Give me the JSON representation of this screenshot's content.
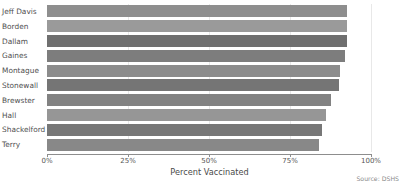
{
  "chart_data": {
    "type": "bar",
    "orientation": "horizontal",
    "title": "",
    "xlabel": "Percent Vaccinated",
    "ylabel": "",
    "xlim": [
      0,
      100
    ],
    "xticks": [
      "0%",
      "25%",
      "50%",
      "75%",
      "100%"
    ],
    "xtick_values": [
      0,
      25,
      50,
      75,
      100
    ],
    "grid": true,
    "legend": "none",
    "categories": [
      "Jeff Davis",
      "Borden",
      "Dallam",
      "Gaines",
      "Montague",
      "Stonewall",
      "Brewster",
      "Hall",
      "Shackelford",
      "Terry"
    ],
    "values": [
      92.5,
      92.5,
      92.5,
      92.0,
      90.5,
      90.0,
      87.5,
      86.0,
      85.0,
      84.0
    ],
    "bar_colors": [
      "#8e8e8e",
      "#9a9a9a",
      "#6f6f6f",
      "#7d7d7d",
      "#8c8c8c",
      "#757575",
      "#828282",
      "#969696",
      "#777777",
      "#888888"
    ],
    "source": "Source: DSHS"
  },
  "footer": {
    "source_label": "Source: DSHS"
  },
  "axis": {
    "x_title": "Percent Vaccinated"
  },
  "style": {
    "gridline_color": "#e8e8e8",
    "axis_color": "#8d8d8d",
    "text_color": "#4a4a4a",
    "background": "#ffffff"
  }
}
